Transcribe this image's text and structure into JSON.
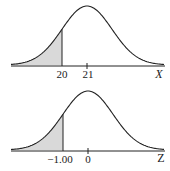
{
  "chart_data": [
    {
      "type": "area",
      "title": "",
      "xlabel": "X",
      "ylabel": "",
      "distribution": "normal",
      "mean": 21,
      "shaded_region": "left tail, X < 20",
      "boundary": 20,
      "tick_labels": [
        "20",
        "21"
      ],
      "grid": false,
      "colors": {
        "curve": "#222222",
        "shade": "#d9d9d9",
        "axis": "#222222"
      }
    },
    {
      "type": "area",
      "title": "",
      "xlabel": "Z",
      "ylabel": "",
      "distribution": "standard normal",
      "mean": 0,
      "shaded_region": "left tail, Z < -1.00",
      "boundary": -1.0,
      "tick_labels": [
        "−1.00",
        "0"
      ],
      "grid": false,
      "colors": {
        "curve": "#222222",
        "shade": "#d9d9d9",
        "axis": "#222222"
      }
    }
  ],
  "top": {
    "boundary_label": "20",
    "mean_label": "21",
    "axis_label": "X"
  },
  "bottom": {
    "boundary_label": "−1.00",
    "mean_label": "0",
    "axis_label": "Z"
  }
}
